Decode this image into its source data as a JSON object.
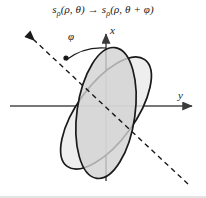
{
  "figure": {
    "title_parts": {
      "lhs_base": "s",
      "lhs_sub": "ρ",
      "lhs_args": "(ρ, θ)",
      "arrow": "→",
      "rhs_base": "s",
      "rhs_sub": "ρ",
      "rhs_args": "(ρ, θ + φ)"
    },
    "axes": {
      "x_label": "x",
      "y_label": "y",
      "origin": {
        "x": 106,
        "y": 106
      },
      "x_axis": {
        "from_y": 180,
        "to_y": 30,
        "label_pos": [
          110,
          25
        ]
      },
      "y_axis": {
        "from_x": 10,
        "to_x": 196,
        "label_pos": [
          178,
          90
        ]
      }
    },
    "angle": {
      "label": "φ",
      "label_pos": [
        68,
        31
      ],
      "value_deg": 28,
      "arc_from": "x-axis",
      "arc_to": "rotated-axis"
    },
    "shapes": [
      {
        "name": "original-ellipse",
        "kind": "ellipse",
        "cx": 106,
        "cy": 113,
        "rx": 29,
        "ry": 66,
        "rotation_deg": 8,
        "fill": "#d4d4d4",
        "fill_opacity": 0.85,
        "stroke": "#1a1a1a",
        "stroke_width": 1.6
      },
      {
        "name": "rotated-ellipse",
        "kind": "ellipse",
        "cx": 106,
        "cy": 113,
        "rx": 29,
        "ry": 66,
        "rotation_deg": 36,
        "fill": "#e8e8e8",
        "fill_opacity": 0.72,
        "stroke": "#1a1a1a",
        "stroke_width": 1.6
      }
    ],
    "rotated_axis": {
      "name": "rotated-axis-dashed",
      "from": [
        30,
        36
      ],
      "to": [
        190,
        186
      ],
      "dash": "5,4",
      "stroke": "#1a1a1a",
      "stroke_width": 1.4,
      "arrow_head_at": "from"
    },
    "marker_point": {
      "x": 66,
      "y": 58,
      "name": "vertex-marker"
    },
    "colors": {
      "stroke": "#1a1a1a",
      "axis": "#4a4a4a",
      "fill_original": "#d4d4d4",
      "fill_rotated": "#e8e8e8",
      "background": "#ffffff",
      "border": "#bdbdbd"
    },
    "border_bottom": true
  }
}
